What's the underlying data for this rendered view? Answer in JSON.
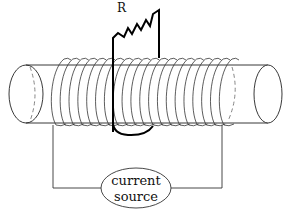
{
  "diagram": {
    "resistor": {
      "label": "R"
    },
    "source": {
      "line1": "current",
      "line2": "source"
    },
    "coil": {
      "turns": 20
    },
    "colors": {
      "stroke": "#111111",
      "background": "#ffffff"
    }
  }
}
